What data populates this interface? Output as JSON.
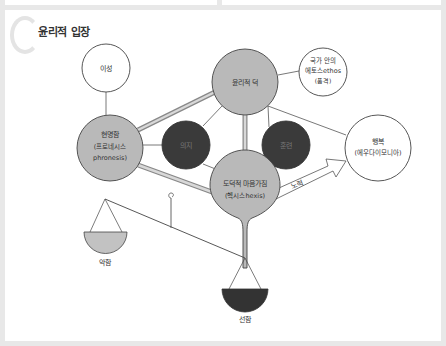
{
  "section": {
    "title": "윤리적 입장"
  },
  "nodes": {
    "reason": {
      "label": "이성"
    },
    "ethical_virtue": {
      "label": "윤리적 덕"
    },
    "ethos": {
      "line1": "국가 안의",
      "line2": "에토스ethos",
      "line3": "(품격)"
    },
    "prudence": {
      "line1": "현명함",
      "line2": "(프로네시스",
      "line3": "phronesis)"
    },
    "will": {
      "label": "의지"
    },
    "training": {
      "label": "훈련"
    },
    "moral_disposition": {
      "line1": "도덕적 마음가짐",
      "line2": "(헥시스hexis)"
    },
    "happiness": {
      "line1": "행복",
      "line2": "(에우다이모니아)"
    }
  },
  "arrow": {
    "label": "노력"
  },
  "scale": {
    "left_pan": {
      "label": "악함"
    },
    "right_pan": {
      "label": "선함"
    }
  },
  "colors": {
    "gray_fill": "#b9b9b9",
    "dark_fill": "#3a3a3a",
    "white_fill": "#ffffff",
    "stroke": "#444444",
    "double_line": "#bdbdbd"
  }
}
